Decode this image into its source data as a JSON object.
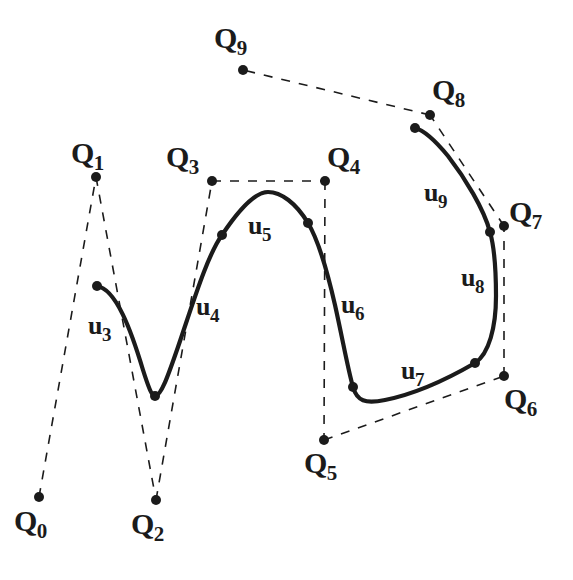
{
  "figure": {
    "kind": "b-spline-curve-with-control-polygon",
    "background_color": "#ffffff",
    "ink_color": "#1b1b1b",
    "width": 573,
    "height": 580,
    "top_clipped_caption": ". . . . ."
  },
  "control_points": [
    {
      "id": "Q0",
      "base": "Q",
      "sub": "0",
      "x": 39,
      "y": 497,
      "label_x": 14,
      "label_y": 506
    },
    {
      "id": "Q1",
      "base": "Q",
      "sub": "1",
      "x": 96,
      "y": 177,
      "label_x": 71,
      "label_y": 138
    },
    {
      "id": "Q2",
      "base": "Q",
      "sub": "2",
      "x": 156,
      "y": 500,
      "label_x": 131,
      "label_y": 509
    },
    {
      "id": "Q3",
      "base": "Q",
      "sub": "3",
      "x": 212,
      "y": 181,
      "label_x": 166,
      "label_y": 142
    },
    {
      "id": "Q4",
      "base": "Q",
      "sub": "4",
      "x": 325,
      "y": 181,
      "label_x": 327,
      "label_y": 142
    },
    {
      "id": "Q5",
      "base": "Q",
      "sub": "5",
      "x": 324,
      "y": 440,
      "label_x": 304,
      "label_y": 448
    },
    {
      "id": "Q6",
      "base": "Q",
      "sub": "6",
      "x": 504,
      "y": 376,
      "label_x": 504,
      "label_y": 384
    },
    {
      "id": "Q7",
      "base": "Q",
      "sub": "7",
      "x": 504,
      "y": 226,
      "label_x": 509,
      "label_y": 197
    },
    {
      "id": "Q8",
      "base": "Q",
      "sub": "8",
      "x": 430,
      "y": 115,
      "label_x": 432,
      "label_y": 75
    },
    {
      "id": "Q9",
      "base": "Q",
      "sub": "9",
      "x": 243,
      "y": 70,
      "label_x": 214,
      "label_y": 23
    }
  ],
  "control_polygon": {
    "style": "dashed",
    "sequence": [
      "Q0",
      "Q1",
      "Q2",
      "Q3",
      "Q4",
      "Q5",
      "Q6",
      "Q7",
      "Q8",
      "Q9"
    ]
  },
  "curve": {
    "style": "solid",
    "start_point": {
      "x": 97,
      "y": 286
    },
    "end_point": {
      "x": 415,
      "y": 128
    },
    "knots": [
      {
        "x": 155,
        "y": 396
      },
      {
        "x": 222,
        "y": 235
      },
      {
        "x": 308,
        "y": 223
      },
      {
        "x": 353,
        "y": 387
      },
      {
        "x": 475,
        "y": 363
      },
      {
        "x": 490,
        "y": 232
      }
    ],
    "path": "M 97 286 C 116 289 131 330 143 370 C 149 389 152 396 155 396 C 161 396 168 376 178 347 C 193 303 207 256 222 235 C 240 208 256 192 268 192 C 281 192 296 203 308 223 C 319 241 327 270 335 305 C 343 341 348 370 353 387 C 357 401 365 404 385 400 C 415 394 444 381 475 363 C 489 354 496 327 496 296 C 496 268 494 246 490 232 C 484 209 465 178 448 156 C 434 139 423 130 415 128"
  },
  "segment_labels": [
    {
      "id": "u3",
      "base": "u",
      "sub": "3",
      "label_x": 88,
      "label_y": 313
    },
    {
      "id": "u4",
      "base": "u",
      "sub": "4",
      "label_x": 196,
      "label_y": 294
    },
    {
      "id": "u5",
      "base": "u",
      "sub": "5",
      "label_x": 248,
      "label_y": 213
    },
    {
      "id": "u6",
      "base": "u",
      "sub": "6",
      "label_x": 341,
      "label_y": 292
    },
    {
      "id": "u7",
      "base": "u",
      "sub": "7",
      "label_x": 401,
      "label_y": 358
    },
    {
      "id": "u8",
      "base": "u",
      "sub": "8",
      "label_x": 461,
      "label_y": 265
    },
    {
      "id": "u9",
      "base": "u",
      "sub": "9",
      "label_x": 424,
      "label_y": 180
    }
  ]
}
